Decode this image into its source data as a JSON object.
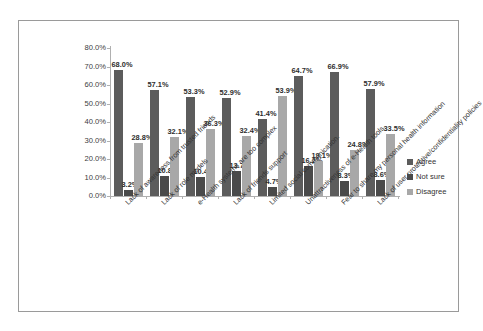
{
  "chart_data": {
    "type": "bar",
    "title": "",
    "subtitle": "",
    "xlabel": "",
    "ylabel": "",
    "ylim": [
      0,
      80
    ],
    "grid": false,
    "legend_position": "right",
    "y_ticks": [
      "80.0%",
      "70.0%",
      "60.0%",
      "50.0%",
      "40.0%",
      "30.0%",
      "20.0%",
      "10.0%",
      "0.0%"
    ],
    "y_tick_values": [
      80,
      70,
      60,
      50,
      40,
      30,
      20,
      10,
      0
    ],
    "categories": [
      "Lack of awareness from trusted friends",
      "Lack of role models",
      "e-Health systems are too complex",
      "Lack of friends support",
      "Limited social communication.",
      "Unattractiveness of e-Health tools",
      "Fear to share my personal health information",
      "Lack of user protective/confidentiality policies"
    ],
    "series": [
      {
        "name": "Agree",
        "color": "#5c5c5c",
        "values": [
          68.0,
          57.1,
          53.3,
          52.9,
          41.4,
          64.7,
          66.9,
          57.9
        ],
        "labels": [
          "68.0%",
          "57.1%",
          "53.3%",
          "52.9%",
          "41.4%",
          "64.7%",
          "66.9%",
          "57.9%"
        ]
      },
      {
        "name": "Not sure",
        "color": "#4a4a4a",
        "values": [
          3.2,
          10.8,
          10.4,
          13.7,
          4.7,
          16.2,
          8.3,
          8.6
        ],
        "labels": [
          "3.2%",
          "10.8%",
          "10.4%",
          "13.7%",
          "4.7%",
          "16.2%",
          "8.3%",
          "8.6%"
        ]
      },
      {
        "name": "Disagree",
        "color": "#a8a8a8",
        "values": [
          28.8,
          32.1,
          36.3,
          32.4,
          53.9,
          19.1,
          24.8,
          33.5
        ],
        "labels": [
          "28.8%",
          "32.1%",
          "36.3%",
          "32.4%",
          "53.9%",
          "19.1%",
          "24.8%",
          "33.5%"
        ]
      }
    ]
  },
  "legend": {
    "items": [
      {
        "label": "Agree",
        "color": "#5c5c5c"
      },
      {
        "label": "Not sure",
        "color": "#4a4a4a"
      },
      {
        "label": "Disagree",
        "color": "#a8a8a8"
      }
    ]
  }
}
